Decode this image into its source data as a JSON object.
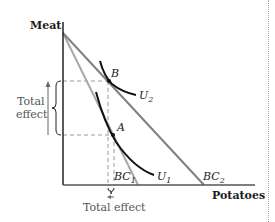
{
  "diagram": {
    "axes": {
      "y_label": "Meat",
      "x_label": "Potatoes"
    },
    "budget_lines": [
      {
        "name": "BC1",
        "label": "BC",
        "subscript": "1",
        "color": "#9a9a9a"
      },
      {
        "name": "BC2",
        "label": "BC",
        "subscript": "2",
        "color": "#7a7a7a"
      }
    ],
    "indifference_curves": [
      {
        "name": "U1",
        "label": "U",
        "subscript": "1",
        "color": "#111111"
      },
      {
        "name": "U2",
        "label": "U",
        "subscript": "2",
        "color": "#111111"
      }
    ],
    "points": [
      {
        "name": "A",
        "label": "A"
      },
      {
        "name": "B",
        "label": "B"
      }
    ],
    "annotations": {
      "vertical_effect_line1": "Total",
      "vertical_effect_line2": "effect",
      "horizontal_effect": "Total effect"
    }
  }
}
